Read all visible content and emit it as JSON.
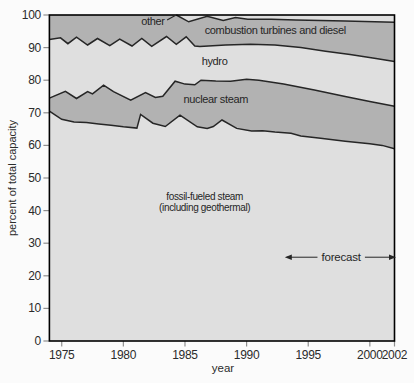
{
  "chart_data": {
    "type": "area",
    "stacked": true,
    "title": "",
    "xlabel": "year",
    "ylabel": "percent of total capacity",
    "xlim": [
      1974,
      2002
    ],
    "ylim": [
      0,
      100
    ],
    "grid": false,
    "x_ticks": [
      1975,
      1980,
      1985,
      1990,
      1995,
      2000,
      2002
    ],
    "y_ticks": [
      0,
      10,
      20,
      30,
      40,
      50,
      60,
      70,
      80,
      90,
      100
    ],
    "bands_bottom_to_top": [
      {
        "name": "fossil-fueled steam (including geothermal)",
        "shade": "light"
      },
      {
        "name": "nuclear steam",
        "shade": "dark"
      },
      {
        "name": "hydro",
        "shade": "light"
      },
      {
        "name": "combustion turbines and diesel",
        "shade": "dark"
      },
      {
        "name": "other",
        "shade": "light"
      }
    ],
    "boundaries": {
      "fossil_top": [
        [
          1974,
          70.5
        ],
        [
          1975,
          68
        ],
        [
          1976,
          67.2
        ],
        [
          1977,
          67
        ],
        [
          1978,
          66.6
        ],
        [
          1979,
          66.2
        ],
        [
          1980,
          65.7
        ],
        [
          1981.1,
          65.3
        ],
        [
          1981.4,
          69.5
        ],
        [
          1982.4,
          66.8
        ],
        [
          1983.4,
          65.8
        ],
        [
          1984.6,
          69.3
        ],
        [
          1986,
          65.7
        ],
        [
          1986.8,
          65.2
        ],
        [
          1987.3,
          65.8
        ],
        [
          1988,
          67.8
        ],
        [
          1989.2,
          65.2
        ],
        [
          1990.4,
          64.4
        ],
        [
          1991.3,
          64.5
        ],
        [
          1992.3,
          64.1
        ],
        [
          1993.6,
          63.7
        ],
        [
          1994.4,
          62.9
        ],
        [
          1996,
          62.2
        ],
        [
          1998,
          61.3
        ],
        [
          2000,
          60.5
        ],
        [
          2001,
          60
        ],
        [
          2002,
          59
        ]
      ],
      "nuclear_top": [
        [
          1974,
          74.5
        ],
        [
          1975.3,
          76.6
        ],
        [
          1976.2,
          74.4
        ],
        [
          1977.1,
          76.5
        ],
        [
          1977.5,
          75.8
        ],
        [
          1978.4,
          78.5
        ],
        [
          1979.2,
          76.5
        ],
        [
          1980.6,
          73.9
        ],
        [
          1981.8,
          76.2
        ],
        [
          1982.6,
          74.7
        ],
        [
          1983.2,
          75.1
        ],
        [
          1984.2,
          79.7
        ],
        [
          1985,
          78.8
        ],
        [
          1985.8,
          78.6
        ],
        [
          1986.3,
          80
        ],
        [
          1987.5,
          79.8
        ],
        [
          1988.7,
          79.7
        ],
        [
          1990,
          80.3
        ],
        [
          1991,
          80
        ],
        [
          1993,
          78.8
        ],
        [
          1995.5,
          77
        ],
        [
          1998,
          75
        ],
        [
          2000,
          73.5
        ],
        [
          2002,
          72
        ]
      ],
      "hydro_top": [
        [
          1974,
          92.5
        ],
        [
          1974.9,
          93
        ],
        [
          1975.5,
          91.2
        ],
        [
          1976.2,
          93.2
        ],
        [
          1977.1,
          90.8
        ],
        [
          1977.9,
          92.8
        ],
        [
          1978.9,
          90.6
        ],
        [
          1979.7,
          92.6
        ],
        [
          1980.7,
          90.5
        ],
        [
          1981.5,
          92.8
        ],
        [
          1982.3,
          90.4
        ],
        [
          1983.5,
          93.4
        ],
        [
          1984.3,
          91
        ],
        [
          1985.1,
          93.3
        ],
        [
          1985.8,
          90.5
        ],
        [
          1986.2,
          90.3
        ],
        [
          1988.3,
          90.8
        ],
        [
          1990.3,
          91
        ],
        [
          1992.3,
          90.8
        ],
        [
          1994.4,
          90
        ],
        [
          1996.4,
          88.9
        ],
        [
          1998.4,
          87.9
        ],
        [
          2000.5,
          86.7
        ],
        [
          2002,
          85.7
        ]
      ],
      "combustion_top": [
        [
          1984.3,
          100
        ],
        [
          1985.3,
          97.9
        ],
        [
          1986.8,
          99.6
        ],
        [
          1988.1,
          98.3
        ],
        [
          1989.1,
          99.2
        ],
        [
          1990.1,
          98.7
        ],
        [
          1992,
          98.7
        ],
        [
          1994,
          98.5
        ],
        [
          1998,
          98.2
        ],
        [
          2002,
          97.8
        ]
      ]
    },
    "labels": [
      {
        "id": "other",
        "text": "other",
        "x": 1982.4,
        "y": 98.0,
        "anchor": "middle",
        "size": 11
      },
      {
        "id": "combustion",
        "text": "combustion turbines and diesel",
        "x": 1986.6,
        "y": 95.1,
        "anchor": "start",
        "size": 11
      },
      {
        "id": "hydro",
        "text": "hydro",
        "x": 1987.4,
        "y": 85.8,
        "anchor": "middle",
        "size": 11
      },
      {
        "id": "nuclear",
        "text": "nuclear steam",
        "x": 1987.5,
        "y": 74.1,
        "anchor": "middle",
        "size": 11
      },
      {
        "id": "fossil-1",
        "text": "fossil-fueled steam",
        "x": 1986.6,
        "y": 44.3,
        "anchor": "middle",
        "size": 10
      },
      {
        "id": "fossil-2",
        "text": "(including geothermal)",
        "x": 1986.6,
        "y": 41.1,
        "anchor": "middle",
        "size": 10
      }
    ],
    "leader_line": {
      "x1": 1983.55,
      "y1": 98.5,
      "x2": 1984.25,
      "y2": 99.9
    },
    "annotation": {
      "text": "forecast",
      "y": 25.7,
      "tip_left": 1993.1,
      "line_left_end": 1995.75,
      "line_right_start": 1999.6,
      "tip_right": 2002.15
    },
    "colors": {
      "band_light": "#dfdfdf",
      "band_dark": "#b2b2b2",
      "line": "#262626",
      "border": "#000000",
      "tick": "#8f8f8f",
      "text": "#2b2b2b",
      "background": "#fbfbfb"
    }
  }
}
